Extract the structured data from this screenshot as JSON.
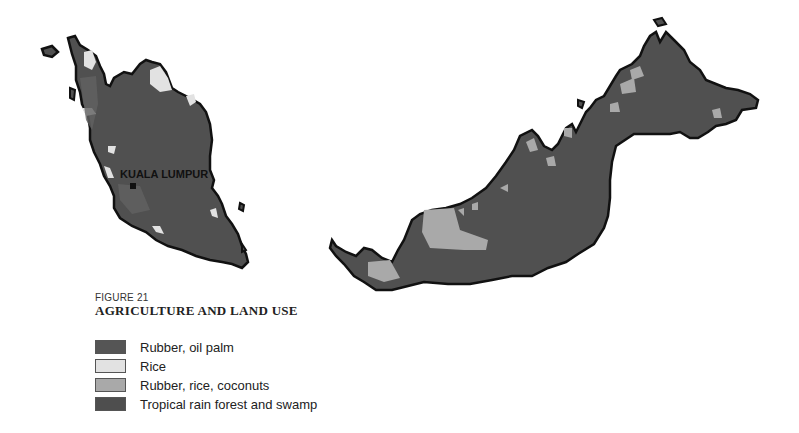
{
  "figure": {
    "number": "FIGURE 21",
    "title": "AGRICULTURE AND LAND USE"
  },
  "legend": {
    "items": [
      {
        "label": "Rubber, oil palm",
        "color": "#555555"
      },
      {
        "label": "Rice",
        "color": "#e2e2e2"
      },
      {
        "label": "Rubber, rice, coconuts",
        "color": "#a9a9a9"
      },
      {
        "label": "Tropical rain forest and swamp",
        "color": "#4e4e4e"
      }
    ]
  },
  "map": {
    "regions": [
      "Peninsular Malaysia",
      "East Malaysia (Sarawak and Sabah)"
    ],
    "cities": [
      {
        "name": "KUALA LUMPUR"
      }
    ],
    "colors": {
      "land": "#505050",
      "outline": "#111111",
      "rice": "#e2e2e2",
      "mixed": "#a9a9a9",
      "rubber": "#626262"
    }
  }
}
